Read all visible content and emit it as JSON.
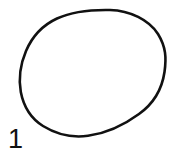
{
  "figure": {
    "label": "1",
    "caption_number": "1",
    "background_color": "#ffffff",
    "ink_color": "#111111",
    "stroke_width": 2.6,
    "canvas": {
      "width": 175,
      "height": 162
    },
    "shapes": [
      {
        "name": "hand-drawn-oval",
        "type": "closed-freehand-ellipse",
        "description": "hand drawn tilted oval outline",
        "stroke": "#111111",
        "fill": "none",
        "bounds": {
          "left": 19,
          "top": 9,
          "right": 166,
          "bottom": 137
        },
        "extrema": {
          "top": [
            110,
            10
          ],
          "right": [
            165,
            66
          ],
          "bottom": [
            88,
            136
          ],
          "left": [
            20,
            82
          ]
        },
        "path": "M 110 10 C 130 10.5 149 20 158 34 C 166 47 166.5 58 164.5 72 C 162 89 153 104 139 114 C 124 125 105 133.5 88 135.8 C 72 138 56 134 43 126 C 31 118.5 23.5 106 20.8 92 C 18.5 79 20.5 64 26 51 C 32 37 43 25 57 18.5 C 71 12 90 9.6 110 10 Z"
      }
    ]
  }
}
